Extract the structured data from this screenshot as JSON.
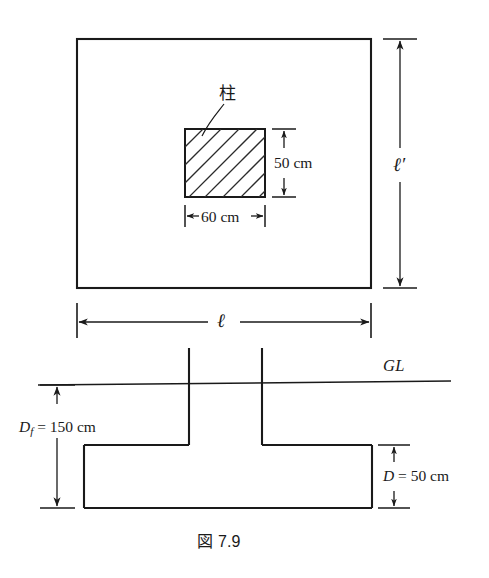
{
  "figure": {
    "caption_prefix": "図",
    "caption_number": "7.9",
    "caption_full": "図 7.9"
  },
  "plan_view": {
    "name": "foundation-plan-view",
    "column_label": "柱",
    "column_width_label": "60 cm",
    "column_height_label": "50 cm",
    "footing_width_symbol": "ℓ",
    "footing_length_symbol": "ℓ′",
    "footing_length_base": "ℓ",
    "footing_length_prime": "′"
  },
  "section_view": {
    "name": "foundation-section-view",
    "ground_line_label": "GL",
    "embedment_symbol": "D",
    "embedment_subscript": "f",
    "embedment_value": "= 150 cm",
    "embedment_full": "Df = 150 cm",
    "thickness_symbol": "D",
    "thickness_value": "= 50 cm",
    "thickness_full": "D = 50 cm"
  },
  "colors": {
    "line": "#1a1a1a",
    "hatch": "#2b2b2b",
    "background": "#ffffff"
  }
}
